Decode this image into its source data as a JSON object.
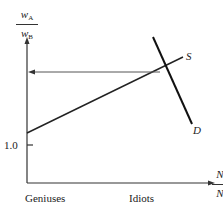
{
  "diagram": {
    "y_axis_label": {
      "num": "w",
      "num_sub": "A",
      "den": "w",
      "den_sub": "B"
    },
    "x_axis_label": {
      "num": "N",
      "num_sub": "I",
      "den": "N",
      "den_sub": "I"
    },
    "tick_label": "1.0",
    "supply_label": "S",
    "demand_label": "D",
    "x_left_label": "Geniuses",
    "x_right_label": "Idiots"
  }
}
